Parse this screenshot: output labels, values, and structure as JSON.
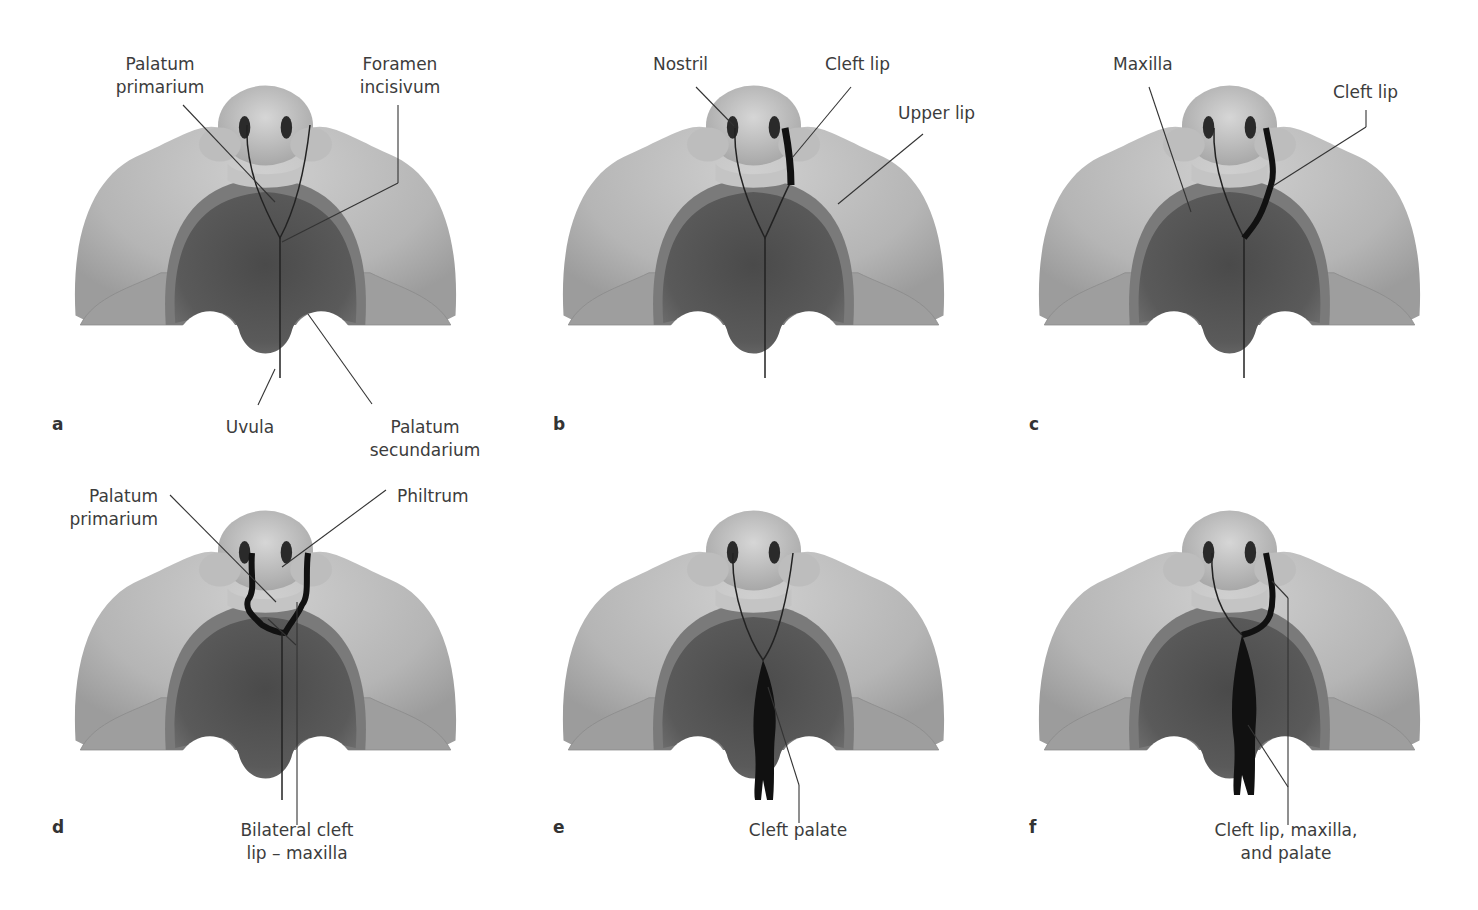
{
  "figure": {
    "panels": [
      {
        "id": "a",
        "letter": "a",
        "labels": {
          "l1": "Palatum\nprimarium",
          "l2": "Foramen\nincisivum",
          "l3": "Uvula",
          "l4": "Palatum\nsecundarium"
        }
      },
      {
        "id": "b",
        "letter": "b",
        "labels": {
          "l1": "Nostril",
          "l2": "Cleft lip",
          "l3": "Upper lip"
        }
      },
      {
        "id": "c",
        "letter": "c",
        "labels": {
          "l1": "Maxilla",
          "l2": "Cleft lip"
        }
      },
      {
        "id": "d",
        "letter": "d",
        "labels": {
          "l1": "Palatum\nprimarium",
          "l2": "Philtrum",
          "l3": "Bilateral cleft\nlip – maxilla"
        }
      },
      {
        "id": "e",
        "letter": "e",
        "labels": {
          "l1": "Cleft palate"
        }
      },
      {
        "id": "f",
        "letter": "f",
        "labels": {
          "l1": "Cleft lip, maxilla,\nand palate"
        }
      }
    ]
  },
  "colors": {
    "face_light": "#b8b8b8",
    "face_mid": "#9a9a9a",
    "palate_dark": "#545454",
    "ridge": "#6e6e6e",
    "cleft": "#101010",
    "leader": "#333333"
  }
}
